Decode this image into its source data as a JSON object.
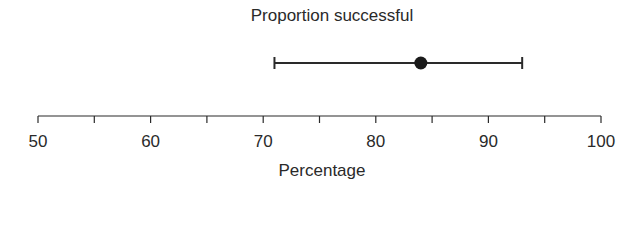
{
  "chart_data": {
    "type": "scatter",
    "subtype": "point-with-error-bar",
    "title": "Proportion successful",
    "xlabel": "Percentage",
    "ylabel": "",
    "xlim": [
      50,
      100
    ],
    "x_ticks_major": [
      50,
      60,
      70,
      80,
      90,
      100
    ],
    "x_ticks_minor": [
      55,
      65,
      75,
      85,
      95
    ],
    "tick_labels": [
      "50",
      "60",
      "70",
      "80",
      "90",
      "100"
    ],
    "series": [
      {
        "name": "Proportion successful",
        "estimate": 84,
        "lower": 71,
        "upper": 93
      }
    ],
    "grid": false,
    "legend": "none",
    "colors": {
      "ink": "#2a2a2a",
      "background": "#ffffff"
    }
  }
}
